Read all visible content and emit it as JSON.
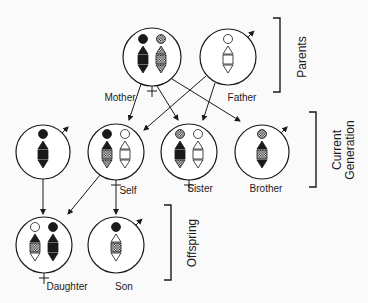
{
  "colors": {
    "ink": "#1a1a1a",
    "background": "#fafafa"
  },
  "groups": [
    {
      "id": "parents",
      "label": "Parents",
      "bracket": {
        "x": 280,
        "y1": 18,
        "y2": 92
      },
      "label_pos": {
        "x": 303,
        "y": 57
      }
    },
    {
      "id": "current",
      "label_line1": "Current",
      "label_line2": "Generation",
      "bracket": {
        "x": 316,
        "y1": 112,
        "y2": 187
      },
      "label_pos": {
        "x": 338,
        "y": 150
      }
    },
    {
      "id": "offspring",
      "label": "Offspring",
      "bracket": {
        "x": 171,
        "y1": 205,
        "y2": 280
      },
      "label_pos": {
        "x": 193,
        "y": 243
      }
    }
  ],
  "individuals": [
    {
      "id": "mother",
      "label": "Mother",
      "sex": "female",
      "cx": 152,
      "cy": 57,
      "r": 29,
      "label_pos": {
        "x": 120,
        "y": 101
      },
      "chromosomes": [
        {
          "x": 143,
          "segments": [
            "black",
            "black",
            "black",
            "black"
          ]
        },
        {
          "x": 161,
          "segments": [
            "hatched",
            "hatched",
            "hatched",
            "hatched"
          ]
        }
      ]
    },
    {
      "id": "father",
      "label": "Father",
      "sex": "male",
      "cx": 228,
      "cy": 57,
      "r": 28,
      "label_pos": {
        "x": 242,
        "y": 101
      },
      "chromosomes": [
        {
          "x": 228,
          "segments": [
            "white",
            "white",
            "white",
            "white"
          ]
        }
      ]
    },
    {
      "id": "spouse",
      "label": "",
      "sex": "male",
      "cx": 43,
      "cy": 152,
      "r": 27,
      "label_pos": null,
      "chromosomes": [
        {
          "x": 43,
          "segments": [
            "black",
            "black",
            "black",
            "black"
          ]
        }
      ]
    },
    {
      "id": "self",
      "label": "Self",
      "sex": "female",
      "cx": 116,
      "cy": 152,
      "r": 28,
      "label_pos": {
        "x": 128,
        "y": 194
      },
      "chromosomes": [
        {
          "x": 107,
          "segments": [
            "black",
            "black",
            "hatched",
            "hatched"
          ]
        },
        {
          "x": 125,
          "segments": [
            "white",
            "white",
            "white",
            "white"
          ]
        }
      ]
    },
    {
      "id": "sister",
      "label": "Sister",
      "sex": "female",
      "cx": 189,
      "cy": 152,
      "r": 28,
      "label_pos": {
        "x": 200,
        "y": 192
      },
      "chromosomes": [
        {
          "x": 180,
          "segments": [
            "hatched",
            "black",
            "black",
            "hatched"
          ]
        },
        {
          "x": 198,
          "segments": [
            "white",
            "white",
            "white",
            "white"
          ]
        }
      ]
    },
    {
      "id": "brother",
      "label": "Brother",
      "sex": "male",
      "cx": 262,
      "cy": 152,
      "r": 27,
      "label_pos": {
        "x": 266,
        "y": 192
      },
      "chromosomes": [
        {
          "x": 262,
          "segments": [
            "hatched",
            "black",
            "hatched",
            "black"
          ]
        }
      ]
    },
    {
      "id": "daughter",
      "label": "Daughter",
      "sex": "female",
      "cx": 44,
      "cy": 245,
      "r": 28,
      "label_pos": {
        "x": 67,
        "y": 290
      },
      "chromosomes": [
        {
          "x": 35,
          "segments": [
            "white",
            "black",
            "hatched",
            "white"
          ]
        },
        {
          "x": 53,
          "segments": [
            "black",
            "black",
            "black",
            "black"
          ]
        }
      ]
    },
    {
      "id": "son",
      "label": "Son",
      "sex": "male",
      "cx": 116,
      "cy": 245,
      "r": 28,
      "label_pos": {
        "x": 124,
        "y": 290
      },
      "chromosomes": [
        {
          "x": 116,
          "segments": [
            "black",
            "white",
            "hatched",
            "white"
          ]
        }
      ]
    }
  ],
  "arrows": [
    {
      "from": "mother",
      "to": "self",
      "x1": 141,
      "y1": 84,
      "x2": 129,
      "y2": 120
    },
    {
      "from": "mother",
      "to": "sister",
      "x1": 157,
      "y1": 86,
      "x2": 178,
      "y2": 120
    },
    {
      "from": "mother",
      "to": "brother",
      "x1": 172,
      "y1": 79,
      "x2": 240,
      "y2": 121
    },
    {
      "from": "father",
      "to": "self",
      "x1": 206,
      "y1": 76,
      "x2": 144,
      "y2": 130
    },
    {
      "from": "father",
      "to": "sister",
      "x1": 215,
      "y1": 83,
      "x2": 203,
      "y2": 120
    },
    {
      "from": "spouse",
      "to": "daughter",
      "x1": 43,
      "y1": 179,
      "x2": 43,
      "y2": 214
    },
    {
      "from": "self",
      "to": "daughter",
      "x1": 100,
      "y1": 175,
      "x2": 68,
      "y2": 214
    },
    {
      "from": "self",
      "to": "son",
      "x1": 116,
      "y1": 191,
      "x2": 116,
      "y2": 214
    }
  ]
}
